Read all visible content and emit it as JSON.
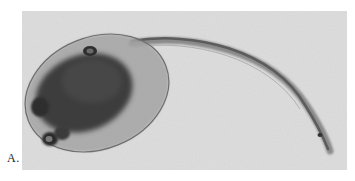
{
  "figure": {
    "panel_label": "A.",
    "colors": {
      "background": "#d9d9d9",
      "body_dark": "#3a3a3a",
      "body_mid": "#7a7a7a",
      "membrane": "#9e9e9e"
    }
  }
}
